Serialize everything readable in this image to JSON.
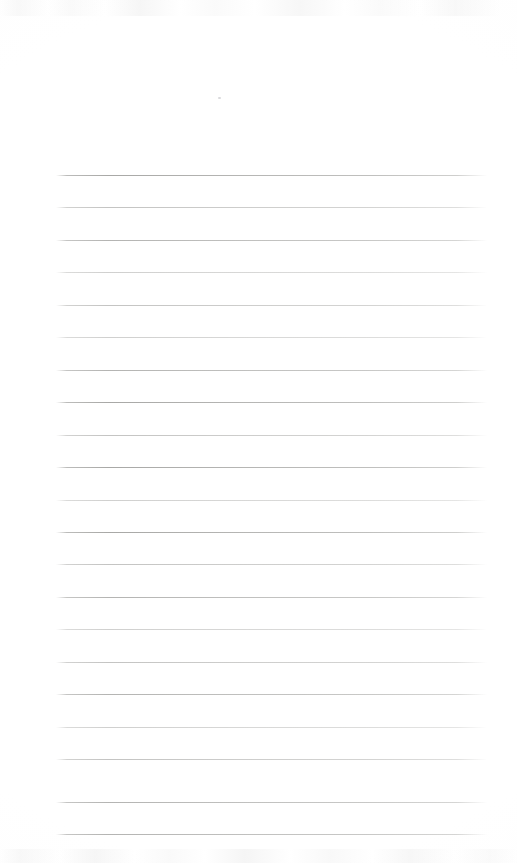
{
  "page": {
    "kind": "scanned-blank-ruled-page",
    "width_px": 517,
    "height_px": 863,
    "background_color": "#ffffff",
    "has_text_content": false,
    "header_area_label": "",
    "footer_area_label": ""
  },
  "ruling": {
    "line_color": "#b0b0ae",
    "line_count": 21,
    "line_left_x": 56,
    "line_right_x": 487,
    "line_length_px": 431,
    "first_line_y": 175,
    "line_spacing_px": 32.45,
    "line_thickness_px": 1,
    "top_margin_px": 175,
    "left_margin_px": 56,
    "right_margin_px": 30,
    "lines": [
      {
        "index": 1,
        "y": 175,
        "weight": "strong",
        "content": ""
      },
      {
        "index": 2,
        "y": 207,
        "weight": "light",
        "content": ""
      },
      {
        "index": 3,
        "y": 240,
        "weight": "mid",
        "content": ""
      },
      {
        "index": 4,
        "y": 272,
        "weight": "faint",
        "content": ""
      },
      {
        "index": 5,
        "y": 305,
        "weight": "light",
        "content": ""
      },
      {
        "index": 6,
        "y": 337,
        "weight": "faint",
        "content": ""
      },
      {
        "index": 7,
        "y": 370,
        "weight": "mid",
        "content": ""
      },
      {
        "index": 8,
        "y": 402,
        "weight": "strong",
        "content": ""
      },
      {
        "index": 9,
        "y": 435,
        "weight": "light",
        "content": ""
      },
      {
        "index": 10,
        "y": 467,
        "weight": "strong",
        "content": ""
      },
      {
        "index": 11,
        "y": 500,
        "weight": "faint",
        "content": ""
      },
      {
        "index": 12,
        "y": 532,
        "weight": "strong",
        "content": ""
      },
      {
        "index": 13,
        "y": 564,
        "weight": "light",
        "content": ""
      },
      {
        "index": 14,
        "y": 597,
        "weight": "mid",
        "content": ""
      },
      {
        "index": 15,
        "y": 629,
        "weight": "faint",
        "content": ""
      },
      {
        "index": 16,
        "y": 662,
        "weight": "light",
        "content": ""
      },
      {
        "index": 17,
        "y": 694,
        "weight": "mid",
        "content": ""
      },
      {
        "index": 18,
        "y": 727,
        "weight": "faint",
        "content": ""
      },
      {
        "index": 19,
        "y": 759,
        "weight": "light",
        "content": ""
      },
      {
        "index": 20,
        "y": 802,
        "weight": "mid",
        "content": ""
      },
      {
        "index": 21,
        "y": 834,
        "weight": "mid",
        "content": ""
      }
    ]
  },
  "artifacts": {
    "top_band_visible": true,
    "bottom_band_visible": true,
    "speck": {
      "x": 218,
      "y": 97
    }
  }
}
